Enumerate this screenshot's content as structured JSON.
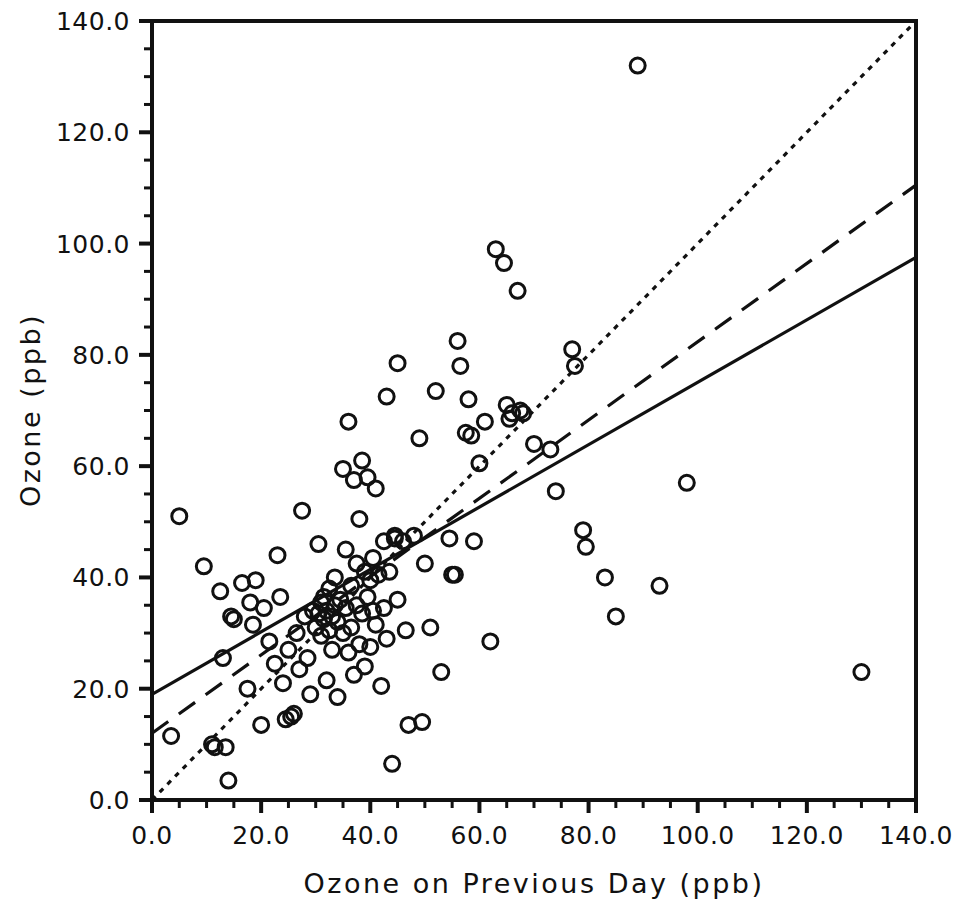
{
  "figure": {
    "background": "#ffffff",
    "ink": "#111111",
    "width": 956,
    "height": 905
  },
  "axes": {
    "x_title": "Ozone on Previous Day (ppb)",
    "y_title": "Ozone (ppb)",
    "x_ticklabels": [
      "0.0",
      "20.0",
      "40.0",
      "60.0",
      "80.0",
      "100.0",
      "120.0",
      "140.0"
    ],
    "y_ticklabels": [
      "0.0",
      "20.0",
      "40.0",
      "60.0",
      "80.0",
      "100.0",
      "120.0",
      "140.0"
    ],
    "x_tickvalues": [
      0,
      20,
      40,
      60,
      80,
      100,
      120,
      140
    ],
    "y_tickvalues": [
      0,
      20,
      40,
      60,
      80,
      100,
      120,
      140
    ],
    "minor_tick_step": 5,
    "frame": "box",
    "grid": false
  },
  "chart_data": {
    "type": "scatter",
    "title": "",
    "xlabel": "Ozone on Previous Day (ppb)",
    "ylabel": "Ozone (ppb)",
    "xlim": [
      0,
      140
    ],
    "ylim": [
      0,
      140
    ],
    "grid": false,
    "legend": "none",
    "marker": {
      "shape": "open-circle",
      "size": 9,
      "edge_color": "#111111",
      "fill": "none"
    },
    "series": [
      {
        "name": "Ozone vs previous day ozone",
        "points": [
          [
            3.5,
            11.5
          ],
          [
            5.0,
            51.0
          ],
          [
            9.5,
            42.0
          ],
          [
            11.0,
            10.0
          ],
          [
            11.5,
            9.5
          ],
          [
            12.5,
            37.5
          ],
          [
            13.0,
            25.5
          ],
          [
            13.5,
            9.5
          ],
          [
            14.0,
            3.5
          ],
          [
            14.5,
            33.0
          ],
          [
            15.0,
            32.5
          ],
          [
            16.5,
            39.0
          ],
          [
            17.5,
            20.0
          ],
          [
            18.0,
            35.5
          ],
          [
            18.5,
            31.5
          ],
          [
            19.0,
            39.5
          ],
          [
            20.0,
            13.5
          ],
          [
            20.5,
            34.5
          ],
          [
            21.5,
            28.5
          ],
          [
            22.5,
            24.5
          ],
          [
            23.0,
            44.0
          ],
          [
            23.5,
            36.5
          ],
          [
            24.0,
            21.0
          ],
          [
            24.5,
            14.5
          ],
          [
            25.0,
            27.0
          ],
          [
            25.5,
            15.0
          ],
          [
            26.0,
            15.5
          ],
          [
            26.5,
            30.0
          ],
          [
            27.0,
            23.5
          ],
          [
            27.5,
            52.0
          ],
          [
            28.0,
            33.0
          ],
          [
            28.5,
            25.5
          ],
          [
            29.0,
            19.0
          ],
          [
            29.5,
            34.0
          ],
          [
            30.0,
            31.0
          ],
          [
            30.5,
            33.5
          ],
          [
            30.5,
            46.0
          ],
          [
            31.0,
            35.5
          ],
          [
            31.0,
            29.5
          ],
          [
            31.5,
            32.5
          ],
          [
            31.5,
            36.5
          ],
          [
            32.0,
            34.0
          ],
          [
            32.0,
            21.5
          ],
          [
            32.5,
            30.5
          ],
          [
            32.5,
            38.0
          ],
          [
            33.0,
            33.0
          ],
          [
            33.0,
            27.0
          ],
          [
            33.5,
            35.0
          ],
          [
            33.5,
            40.0
          ],
          [
            34.0,
            32.0
          ],
          [
            34.0,
            18.5
          ],
          [
            34.5,
            36.0
          ],
          [
            35.0,
            30.0
          ],
          [
            35.0,
            59.5
          ],
          [
            35.5,
            34.5
          ],
          [
            35.5,
            45.0
          ],
          [
            36.0,
            26.5
          ],
          [
            36.0,
            68.0
          ],
          [
            36.5,
            31.0
          ],
          [
            36.5,
            38.5
          ],
          [
            37.0,
            22.5
          ],
          [
            37.0,
            57.5
          ],
          [
            37.5,
            35.0
          ],
          [
            37.5,
            42.5
          ],
          [
            38.0,
            28.0
          ],
          [
            38.0,
            50.5
          ],
          [
            38.5,
            33.5
          ],
          [
            38.5,
            61.0
          ],
          [
            39.0,
            41.0
          ],
          [
            39.0,
            24.0
          ],
          [
            39.5,
            36.5
          ],
          [
            39.5,
            58.0
          ],
          [
            40.0,
            39.5
          ],
          [
            40.0,
            27.5
          ],
          [
            40.5,
            43.5
          ],
          [
            40.5,
            34.0
          ],
          [
            41.0,
            56.0
          ],
          [
            41.0,
            31.5
          ],
          [
            41.5,
            40.5
          ],
          [
            42.0,
            20.5
          ],
          [
            42.5,
            46.5
          ],
          [
            42.5,
            34.5
          ],
          [
            43.0,
            72.5
          ],
          [
            43.0,
            29.0
          ],
          [
            43.5,
            41.0
          ],
          [
            44.0,
            6.5
          ],
          [
            44.5,
            47.5
          ],
          [
            44.5,
            47.0
          ],
          [
            45.0,
            78.5
          ],
          [
            45.0,
            36.0
          ],
          [
            46.0,
            46.5
          ],
          [
            46.5,
            30.5
          ],
          [
            47.0,
            13.5
          ],
          [
            48.0,
            47.5
          ],
          [
            49.0,
            65.0
          ],
          [
            49.5,
            14.0
          ],
          [
            50.0,
            42.5
          ],
          [
            51.0,
            31.0
          ],
          [
            52.0,
            73.5
          ],
          [
            53.0,
            23.0
          ],
          [
            54.5,
            47.0
          ],
          [
            55.0,
            40.5
          ],
          [
            55.5,
            40.5
          ],
          [
            56.0,
            82.5
          ],
          [
            56.5,
            78.0
          ],
          [
            57.5,
            66.0
          ],
          [
            58.0,
            72.0
          ],
          [
            58.5,
            65.5
          ],
          [
            59.0,
            46.5
          ],
          [
            60.0,
            60.5
          ],
          [
            61.0,
            68.0
          ],
          [
            62.0,
            28.5
          ],
          [
            63.0,
            99.0
          ],
          [
            64.5,
            96.5
          ],
          [
            65.0,
            71.0
          ],
          [
            65.5,
            68.5
          ],
          [
            66.0,
            69.5
          ],
          [
            67.0,
            91.5
          ],
          [
            67.5,
            70.0
          ],
          [
            68.0,
            69.5
          ],
          [
            70.0,
            64.0
          ],
          [
            73.0,
            63.0
          ],
          [
            74.0,
            55.5
          ],
          [
            77.0,
            81.0
          ],
          [
            77.5,
            78.0
          ],
          [
            79.0,
            48.5
          ],
          [
            79.5,
            45.5
          ],
          [
            83.0,
            40.0
          ],
          [
            85.0,
            33.0
          ],
          [
            89.0,
            132.0
          ],
          [
            93.0,
            38.5
          ],
          [
            98.0,
            57.0
          ],
          [
            130.0,
            23.0
          ]
        ]
      }
    ],
    "reference_lines": [
      {
        "name": "identity-line",
        "style": "dotted",
        "from": [
          0,
          0
        ],
        "to": [
          140,
          140
        ]
      },
      {
        "name": "dashed-regression-line",
        "style": "dashed",
        "from": [
          0,
          12.0
        ],
        "to": [
          140,
          110.5
        ]
      },
      {
        "name": "solid-regression-line",
        "style": "solid",
        "from": [
          0,
          19.0
        ],
        "to": [
          140,
          97.5
        ]
      }
    ]
  }
}
